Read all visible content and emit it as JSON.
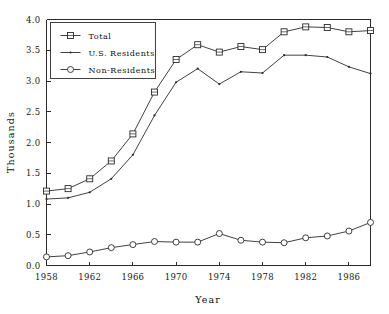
{
  "chart_data": {
    "type": "line",
    "title": "",
    "xlabel": "Year",
    "ylabel": "Thousands",
    "xlim": [
      1958,
      1988
    ],
    "ylim": [
      0.0,
      4.0
    ],
    "grid": false,
    "legend_position": "upper-left",
    "x": [
      1958,
      1960,
      1962,
      1964,
      1966,
      1968,
      1970,
      1972,
      1974,
      1976,
      1978,
      1980,
      1982,
      1984,
      1986,
      1988
    ],
    "x_tick_labels": [
      "1958",
      "1962",
      "1966",
      "1970",
      "1974",
      "1978",
      "1982",
      "1986"
    ],
    "x_tick_values": [
      1958,
      1962,
      1966,
      1970,
      1974,
      1978,
      1982,
      1986
    ],
    "y_tick_labels": [
      "0.0",
      "0.5",
      "1.0",
      "1.5",
      "2.0",
      "2.5",
      "3.0",
      "3.5",
      "4.0"
    ],
    "y_tick_values": [
      0.0,
      0.5,
      1.0,
      1.5,
      2.0,
      2.5,
      3.0,
      3.5,
      4.0
    ],
    "series": [
      {
        "name": "Total",
        "marker": "square",
        "values": [
          1.21,
          1.25,
          1.41,
          1.7,
          2.14,
          2.82,
          3.35,
          3.59,
          3.47,
          3.56,
          3.51,
          3.8,
          3.88,
          3.87,
          3.8,
          3.82
        ]
      },
      {
        "name": "U.S. Residents",
        "marker": "dot",
        "values": [
          1.08,
          1.1,
          1.19,
          1.41,
          1.8,
          2.44,
          2.98,
          3.2,
          2.95,
          3.15,
          3.13,
          3.42,
          3.42,
          3.39,
          3.23,
          3.12
        ]
      },
      {
        "name": "Non-Residents",
        "marker": "circle",
        "values": [
          0.14,
          0.16,
          0.22,
          0.29,
          0.34,
          0.39,
          0.38,
          0.38,
          0.52,
          0.41,
          0.38,
          0.37,
          0.45,
          0.48,
          0.56,
          0.7
        ]
      }
    ]
  },
  "legend": {
    "entries": [
      {
        "label": "Total",
        "marker": "square"
      },
      {
        "label": "U.S. Residents",
        "marker": "dot"
      },
      {
        "label": "Non-Residents",
        "marker": "circle"
      }
    ]
  },
  "colors": {
    "ink": "#2b2b2b",
    "background": "#ffffff"
  }
}
